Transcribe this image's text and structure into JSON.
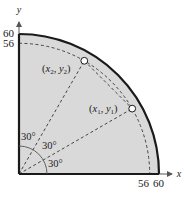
{
  "diagram": {
    "axes": {
      "x_label": "x",
      "y_label": "y"
    },
    "ticks": {
      "x": [
        "56",
        "60"
      ],
      "y": [
        "60",
        "56"
      ]
    },
    "regions": {
      "outer_radius": 60,
      "inner_radius": 56,
      "fill_color": "#d9d9d9",
      "outer_stroke": "#1a1a1a"
    },
    "points": [
      {
        "label": "(x1, y1)",
        "name": "x",
        "sub": "1",
        "name2": "y",
        "sub2": "1",
        "angle_deg": 30
      },
      {
        "label": "(x2, y2)",
        "name": "x",
        "sub": "2",
        "name2": "y",
        "sub2": "2",
        "angle_deg": 60
      }
    ],
    "angles": [
      "30°",
      "30°",
      "30°"
    ]
  }
}
